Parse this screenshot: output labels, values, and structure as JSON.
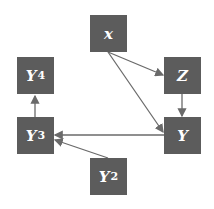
{
  "diagram": {
    "nodes": [
      {
        "id": "x",
        "label": "x",
        "sub": "",
        "left": 90,
        "top": 15
      },
      {
        "id": "Z",
        "label": "Z",
        "sub": "",
        "left": 164,
        "top": 57
      },
      {
        "id": "Y",
        "label": "Y",
        "sub": "",
        "left": 164,
        "top": 117
      },
      {
        "id": "Y4",
        "label": "Y",
        "sub": "4",
        "left": 17,
        "top": 57
      },
      {
        "id": "Y3",
        "label": "Y",
        "sub": "3",
        "left": 17,
        "top": 117
      },
      {
        "id": "Y2",
        "label": "Y",
        "sub": "2",
        "left": 90,
        "top": 158
      }
    ],
    "edges": [
      {
        "from": "x",
        "to": "Z"
      },
      {
        "from": "x",
        "to": "Y"
      },
      {
        "from": "Z",
        "to": "Y"
      },
      {
        "from": "Y",
        "to": "Y3"
      },
      {
        "from": "Y2",
        "to": "Y3"
      },
      {
        "from": "Y3",
        "to": "Y4"
      }
    ],
    "colors": {
      "node_fill": "#5c5c5c",
      "node_text": "#ffffff",
      "edge": "#6a6a6a"
    }
  }
}
